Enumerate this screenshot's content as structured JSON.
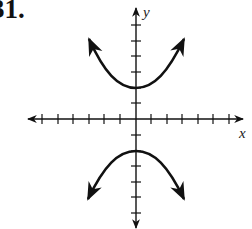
{
  "problem": {
    "label": "31."
  },
  "graph": {
    "x_axis_label": "x",
    "y_axis_label": "y",
    "x_ticks": [
      -6,
      -5,
      -4,
      -3,
      -2,
      -1,
      1,
      2,
      3,
      4,
      5,
      6
    ],
    "y_ticks": [
      -7,
      -6,
      -5,
      -4,
      -3,
      -2,
      -1,
      1,
      2,
      3,
      4,
      5,
      6,
      7
    ],
    "curve": "hyperbola opening up and down",
    "vertices": [
      [
        0,
        2
      ],
      [
        0,
        -2
      ]
    ],
    "colors": {
      "ink": "#111111",
      "background": "#ffffff"
    }
  }
}
